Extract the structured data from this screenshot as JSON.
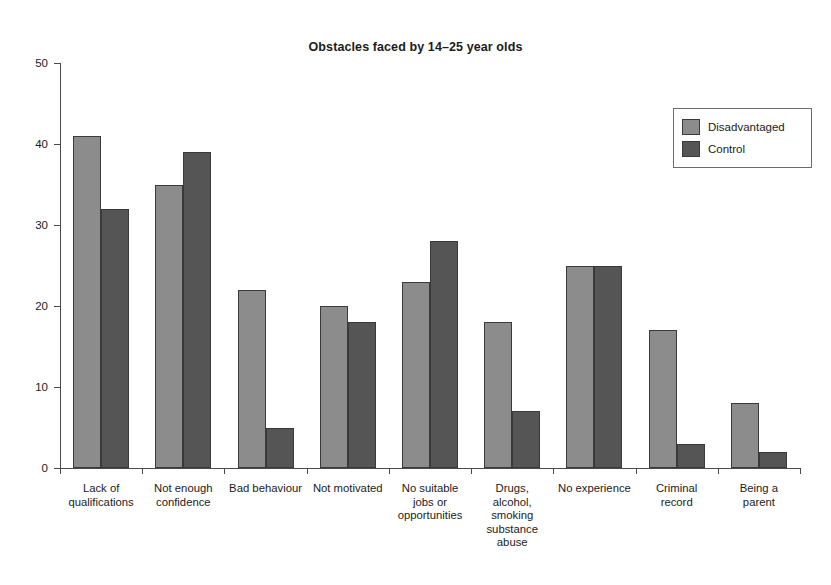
{
  "chart_data": {
    "type": "bar",
    "title": "Obstacles faced by 14–25 year olds",
    "xlabel": "",
    "ylabel": "",
    "ylim": [
      0,
      50
    ],
    "yticks": [
      0,
      10,
      20,
      30,
      40,
      50
    ],
    "ytick_labels": [
      "0",
      "10",
      "20",
      "30",
      "40",
      "50"
    ],
    "grid": false,
    "legend_position": "top-right",
    "categories": [
      "Lack of\nqualifications",
      "Not enough\nconfidence",
      "Bad behaviour",
      "Not motivated",
      "No suitable\njobs or\nopportunities",
      "Drugs,\nalcohol,\nsmoking\nsubstance\nabuse",
      "No experience",
      "Criminal\nrecord",
      "Being a\nparent"
    ],
    "series": [
      {
        "name": "Disadvantaged",
        "color": "#8c8c8c",
        "values": [
          41,
          35,
          22,
          20,
          23,
          18,
          25,
          17,
          8
        ]
      },
      {
        "name": "Control",
        "color": "#555555",
        "values": [
          32,
          39,
          5,
          18,
          28,
          7,
          25,
          3,
          2
        ]
      }
    ]
  },
  "legend": {
    "entries": [
      {
        "label": "Disadvantaged"
      },
      {
        "label": "Control"
      }
    ]
  }
}
